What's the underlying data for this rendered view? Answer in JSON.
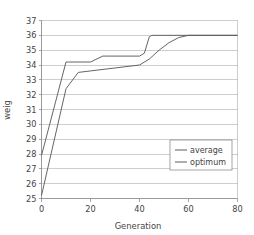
{
  "chart_data": {
    "type": "line",
    "title": "",
    "xlabel": "Generation",
    "ylabel": "weig",
    "xlim": [
      0,
      80
    ],
    "ylim": [
      25,
      37
    ],
    "xticks": [
      0,
      20,
      40,
      60,
      80
    ],
    "yticks": [
      25,
      26,
      27,
      28,
      29,
      30,
      31,
      32,
      33,
      34,
      35,
      36,
      37
    ],
    "xtick_labels": [
      "0",
      "20",
      "40",
      "60",
      "80"
    ],
    "ytick_labels": [
      "25",
      "26",
      "27",
      "28",
      "29",
      "30",
      "31",
      "32",
      "33",
      "34",
      "35",
      "36",
      "37"
    ],
    "grid": "horizontal",
    "legend_position": "center-right",
    "legend_entries": [
      "average",
      "optimum"
    ],
    "series": [
      {
        "name": "optimum",
        "color": "#5d5d5d",
        "x": [
          0,
          10,
          11,
          20,
          25,
          26,
          40,
          42,
          44,
          45,
          80
        ],
        "y": [
          27.9,
          34.2,
          34.2,
          34.2,
          34.6,
          34.6,
          34.6,
          34.8,
          35.9,
          36.0,
          36.0
        ]
      },
      {
        "name": "average",
        "color": "#5d5d5d",
        "x": [
          0,
          10,
          15,
          20,
          30,
          40,
          44,
          48,
          52,
          56,
          60,
          80
        ],
        "y": [
          25.2,
          32.4,
          33.5,
          33.6,
          33.8,
          34.0,
          34.4,
          35.0,
          35.5,
          35.85,
          36.0,
          36.0
        ]
      }
    ]
  },
  "legend": {
    "average_label": "average",
    "optimum_label": "optimum"
  },
  "axes": {
    "x_title": "Generation",
    "y_title": "weig"
  }
}
